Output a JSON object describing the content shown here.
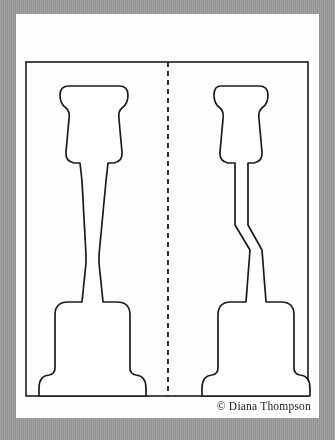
{
  "document": {
    "type": "pattern-template-scan",
    "title": "Two-piece cut-out pattern template",
    "page_background_color": "#fefefe",
    "scan_border_color": "#9b9b9b",
    "ink_color": "#1b1b1b"
  },
  "frame": {
    "name": "pattern-border-rectangle",
    "x": 26,
    "y": 62,
    "width": 282,
    "height": 334,
    "stroke_width": 1.6
  },
  "fold_line": {
    "name": "center-dashed-fold-line",
    "x": 168,
    "y_start": 62,
    "y_end": 396,
    "dash": "5 4",
    "stroke_width": 1.8
  },
  "shapes": [
    {
      "id": "left-piece",
      "label": "Left pattern piece",
      "description": "Rounded flared head, long tapering stem, wide flat base with stepped foot",
      "head_top": 86,
      "head_left": 70,
      "head_right": 128,
      "base_bottom": 396
    },
    {
      "id": "right-piece",
      "label": "Right pattern piece",
      "description": "Rounded flared head, narrow straight stem flaring into a spear, wide flat base with stepped foot",
      "head_top": 86,
      "head_left": 212,
      "head_right": 268,
      "base_bottom": 396
    }
  ],
  "credit": {
    "text": "© Diana Thompson",
    "symbol": "©",
    "author": "Diana Thompson"
  }
}
